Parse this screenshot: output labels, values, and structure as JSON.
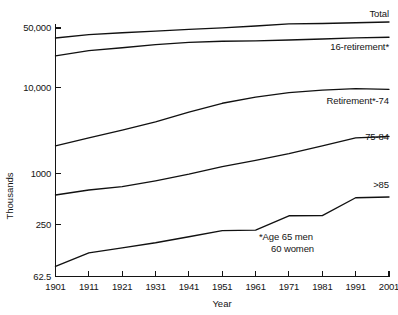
{
  "chart_data": {
    "type": "line",
    "title": "",
    "xlabel": "Year",
    "ylabel": "Thousands",
    "x": [
      1901,
      1911,
      1921,
      1931,
      1941,
      1951,
      1961,
      1971,
      1981,
      1991,
      2001
    ],
    "xlim": [
      1901,
      2001
    ],
    "ylim": [
      62.5,
      70000
    ],
    "yscale": "log",
    "grid": false,
    "legend_position": "inline-right-of-line-ends",
    "ytick_labels": [
      "50,000",
      "10,000",
      "1000",
      "250",
      "62.5"
    ],
    "ytick_values": [
      50000,
      10000,
      1000,
      250,
      62.5
    ],
    "xtick_labels": [
      "1901",
      "1911",
      "1921",
      "1931",
      "1941",
      "1951",
      "1961",
      "1971",
      "1981",
      "1991",
      "2001"
    ],
    "series": [
      {
        "name": "Total",
        "label": "Total",
        "values": [
          38200,
          41800,
          44000,
          46000,
          48200,
          50200,
          52800,
          55800,
          56400,
          57600,
          58800
        ]
      },
      {
        "name": "16-retirement*",
        "label": "16-retirement*",
        "values": [
          23600,
          27200,
          29400,
          32000,
          34000,
          35000,
          35400,
          36200,
          37200,
          38400,
          39000
        ]
      },
      {
        "name": "Retirement*-74",
        "label": "Retirement*-74",
        "values": [
          2100,
          2600,
          3200,
          4000,
          5200,
          6600,
          7800,
          8800,
          9400,
          9800,
          9600
        ]
      },
      {
        "name": "75-84",
        "label": "75-84",
        "values": [
          560,
          640,
          700,
          820,
          980,
          1200,
          1420,
          1700,
          2100,
          2600,
          2700
        ]
      },
      {
        "name": ">85",
        "label": ">85",
        "values": [
          82,
          118,
          135,
          155,
          182,
          215,
          218,
          320,
          322,
          520,
          530
        ]
      }
    ],
    "annotations": [
      {
        "id": "footnote-line-1",
        "text": "*Age 65 men"
      },
      {
        "id": "footnote-line-2",
        "text": "60 women"
      }
    ],
    "colors": {
      "line": "#111111",
      "axis": "#141414",
      "background": "#ffffff"
    }
  }
}
